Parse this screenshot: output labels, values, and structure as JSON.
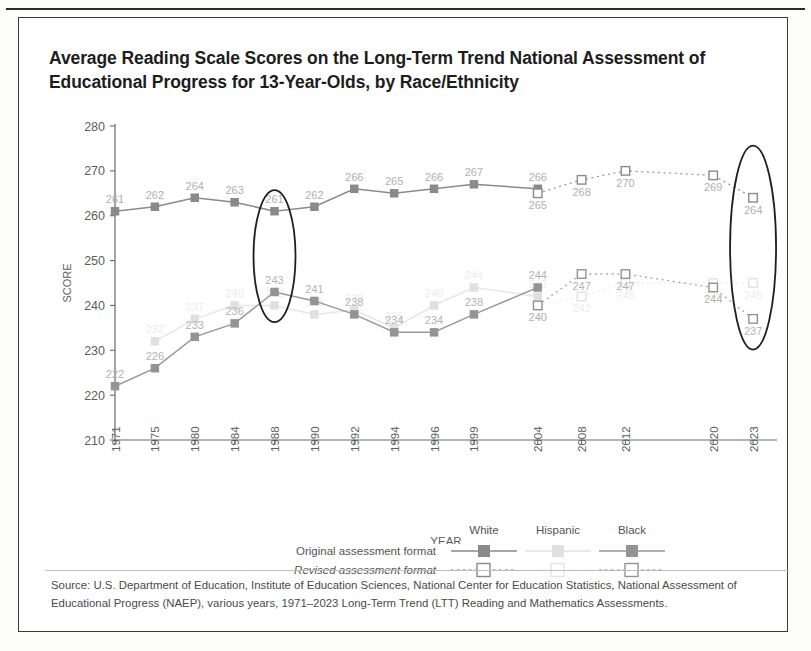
{
  "title": "Average Reading Scale Scores on the Long-Term Trend National Assessment of Educational Progress for 13-Year-Olds, by Race/Ethnicity",
  "axes": {
    "ylabel": "SCORE",
    "xlabel": "YEAR",
    "yticks": [
      "280",
      "270",
      "260",
      "250",
      "240",
      "230",
      "220",
      "210"
    ],
    "xticks": [
      "1971",
      "1975",
      "1980",
      "1984",
      "1988",
      "1990",
      "1992",
      "1994",
      "1996",
      "1999",
      "2004",
      "2008",
      "2012",
      "2020",
      "2023"
    ]
  },
  "legend": {
    "columns": [
      "White",
      "Hispanic",
      "Black"
    ],
    "rows": [
      "Original assessment format",
      "Revised assessment format"
    ]
  },
  "source": "Source: U.S. Department of Education, Institute of Education Sciences, National Center for Education Statistics, National Assessment of Educational Progress (NAEP), various years, 1971–2023 Long-Term Trend (LTT) Reading and Mathematics Assessments.",
  "colors": {
    "white_series": "#8a8a8a",
    "hispanic_series": "#d8d8d8",
    "black_series": "#9a9a9a",
    "axis": "#6b6b6b",
    "label": "#a8a8a8",
    "oval": "#1f1f1f"
  },
  "annotations": {
    "ovals": [
      "1988-highlight",
      "2023-highlight"
    ]
  },
  "chart_data": {
    "type": "line",
    "title": "Average Reading Scale Scores on the Long-Term Trend National Assessment of Educational Progress for 13-Year-Olds, by Race/Ethnicity",
    "xlabel": "YEAR",
    "ylabel": "SCORE",
    "ylim": [
      210,
      280
    ],
    "grid": false,
    "legend_position": "below-axis",
    "x": [
      "1971",
      "1975",
      "1980",
      "1984",
      "1988",
      "1990",
      "1992",
      "1994",
      "1996",
      "1999",
      "2004",
      "2008",
      "2012",
      "2020",
      "2023"
    ],
    "series": [
      {
        "name": "White",
        "format": "Original assessment format",
        "marker": "filled-square",
        "line": "solid",
        "points": [
          {
            "year": "1971",
            "value": 261
          },
          {
            "year": "1975",
            "value": 262
          },
          {
            "year": "1980",
            "value": 264
          },
          {
            "year": "1984",
            "value": 263
          },
          {
            "year": "1988",
            "value": 261
          },
          {
            "year": "1990",
            "value": 262
          },
          {
            "year": "1992",
            "value": 266
          },
          {
            "year": "1994",
            "value": 265
          },
          {
            "year": "1996",
            "value": 266
          },
          {
            "year": "1999",
            "value": 267
          },
          {
            "year": "2004",
            "value": 266
          }
        ]
      },
      {
        "name": "White",
        "format": "Revised assessment format",
        "marker": "open-square",
        "line": "dotted",
        "points": [
          {
            "year": "2004",
            "value": 265
          },
          {
            "year": "2008",
            "value": 268
          },
          {
            "year": "2012",
            "value": 270
          },
          {
            "year": "2020",
            "value": 269
          },
          {
            "year": "2023",
            "value": 264
          }
        ]
      },
      {
        "name": "Hispanic",
        "format": "Original assessment format",
        "marker": "filled-square",
        "line": "solid",
        "points": [
          {
            "year": "1975",
            "value": 232
          },
          {
            "year": "1980",
            "value": 237
          },
          {
            "year": "1984",
            "value": 240
          },
          {
            "year": "1988",
            "value": 240
          },
          {
            "year": "1990",
            "value": 238
          },
          {
            "year": "1992",
            "value": 239
          },
          {
            "year": "1994",
            "value": 235
          },
          {
            "year": "1996",
            "value": 240
          },
          {
            "year": "1999",
            "value": 244
          },
          {
            "year": "2004",
            "value": 242
          }
        ]
      },
      {
        "name": "Hispanic",
        "format": "Revised assessment format",
        "marker": "open-square",
        "line": "dotted",
        "points": [
          {
            "year": "2004",
            "value": 240
          },
          {
            "year": "2008",
            "value": 242
          },
          {
            "year": "2012",
            "value": 245
          },
          {
            "year": "2020",
            "value": 245
          },
          {
            "year": "2023",
            "value": 245
          }
        ]
      },
      {
        "name": "Black",
        "format": "Original assessment format",
        "marker": "filled-square",
        "line": "solid",
        "points": [
          {
            "year": "1971",
            "value": 222
          },
          {
            "year": "1975",
            "value": 226
          },
          {
            "year": "1980",
            "value": 233
          },
          {
            "year": "1984",
            "value": 236
          },
          {
            "year": "1988",
            "value": 243
          },
          {
            "year": "1990",
            "value": 241
          },
          {
            "year": "1992",
            "value": 238
          },
          {
            "year": "1994",
            "value": 234
          },
          {
            "year": "1996",
            "value": 234
          },
          {
            "year": "1999",
            "value": 238
          },
          {
            "year": "2004",
            "value": 244
          }
        ]
      },
      {
        "name": "Black",
        "format": "Revised assessment format",
        "marker": "open-square",
        "line": "dotted",
        "points": [
          {
            "year": "2004",
            "value": 240
          },
          {
            "year": "2008",
            "value": 247
          },
          {
            "year": "2012",
            "value": 247
          },
          {
            "year": "2020",
            "value": 244
          },
          {
            "year": "2023",
            "value": 237
          }
        ]
      }
    ]
  }
}
